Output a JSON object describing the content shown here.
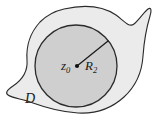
{
  "figure": {
    "background_color": "#ffffff",
    "labels": {
      "region": "D",
      "center_point_base": "z",
      "center_point_sub": "0",
      "radius_base": "R",
      "radius_sub": "2"
    },
    "colors": {
      "region_fill": "#ebebeb",
      "disk_fill": "#cfcfcf",
      "outline": "#2b2b2b",
      "radius_line": "#1c1c1c",
      "center_dot": "#111111",
      "label_text": "#1b1b1b"
    },
    "geometry": {
      "disk_center_x": 76,
      "disk_center_y": 66,
      "disk_radius": 41,
      "radius_endpoint_x": 108,
      "radius_endpoint_y": 41
    }
  }
}
